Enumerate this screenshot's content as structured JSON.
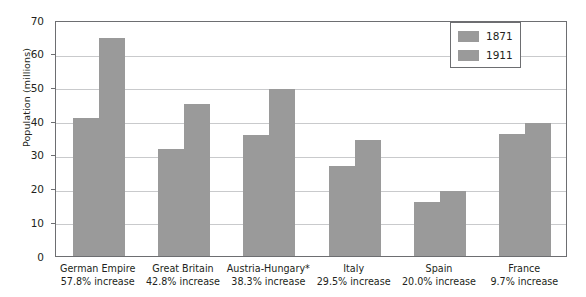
{
  "chart_data": {
    "type": "bar",
    "title": "",
    "xlabel": "",
    "ylabel": "Population (millions)",
    "ylim": [
      0,
      70
    ],
    "yticks": [
      0,
      10,
      20,
      30,
      40,
      50,
      60,
      70
    ],
    "grid": true,
    "legend_position": "top-right",
    "categories": [
      "German Empire",
      "Great Britain",
      "Austria-Hungary*",
      "Italy",
      "Spain",
      "France"
    ],
    "category_sublabels": [
      "57.8% increase",
      "42.8% increase",
      "38.3% increase",
      "29.5% increase",
      "20.0% increase",
      "9.7% increase"
    ],
    "series": [
      {
        "name": "1871",
        "values": [
          41.0,
          31.8,
          36.0,
          26.6,
          16.0,
          36.1
        ]
      },
      {
        "name": "1911",
        "values": [
          64.6,
          45.2,
          49.5,
          34.5,
          19.2,
          39.6
        ]
      }
    ],
    "colors": {
      "bar": "#9a9a9a",
      "gridline": "#c9cacc",
      "frame": "#6d6e71",
      "text": "#231f20",
      "background": "#ffffff"
    }
  },
  "legend": {
    "entries": [
      {
        "label": "1871"
      },
      {
        "label": "1911"
      }
    ]
  }
}
